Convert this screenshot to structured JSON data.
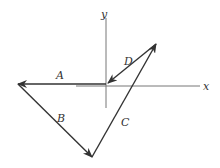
{
  "diagram": {
    "type": "vector-diagram",
    "axes": {
      "x_label": "x",
      "y_label": "y"
    },
    "vectors": [
      {
        "label": "A",
        "from": [
          106,
          84
        ],
        "to": [
          18,
          84
        ]
      },
      {
        "label": "B",
        "from": [
          18,
          84
        ],
        "to": [
          92,
          157
        ]
      },
      {
        "label": "C",
        "from": [
          92,
          157
        ],
        "to": [
          156,
          44
        ]
      },
      {
        "label": "D",
        "from": [
          156,
          44
        ],
        "to": [
          108,
          83
        ]
      }
    ],
    "colors": {
      "line": "#333333",
      "axis": "#777777"
    }
  }
}
